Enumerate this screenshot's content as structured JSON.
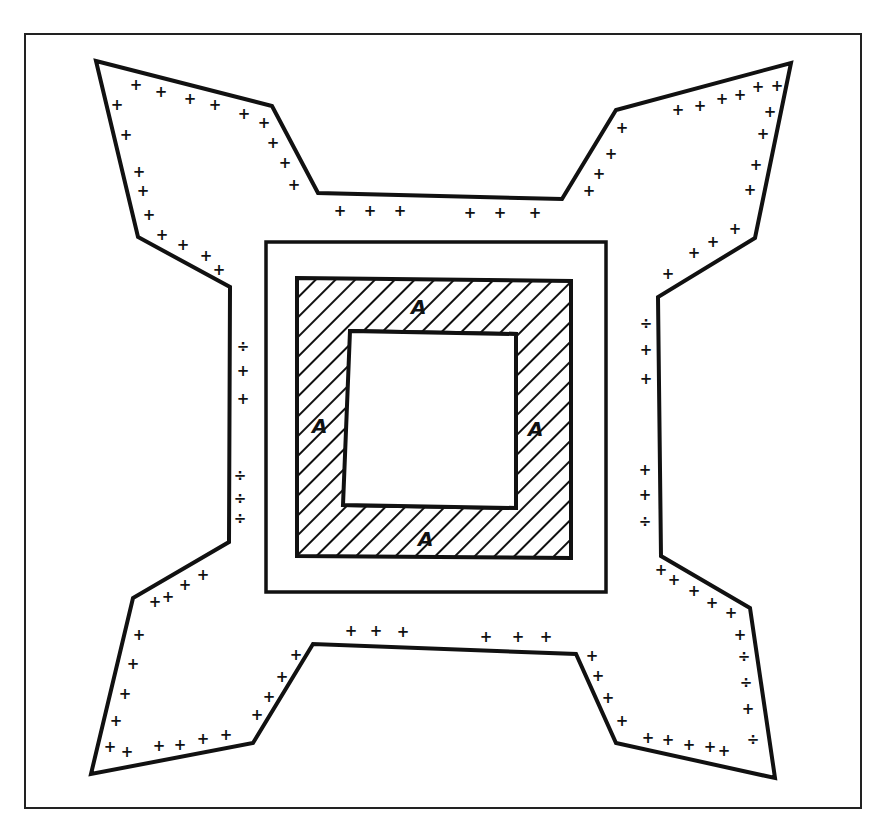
{
  "figure": {
    "type": "patent line drawing",
    "stroke_color": "#111111",
    "background_color": "#ffffff"
  },
  "labels": {
    "top": "A",
    "left": "A",
    "right": "A",
    "bottom": "A"
  },
  "marks": {
    "glyph": "+",
    "alt_glyph": "÷"
  }
}
